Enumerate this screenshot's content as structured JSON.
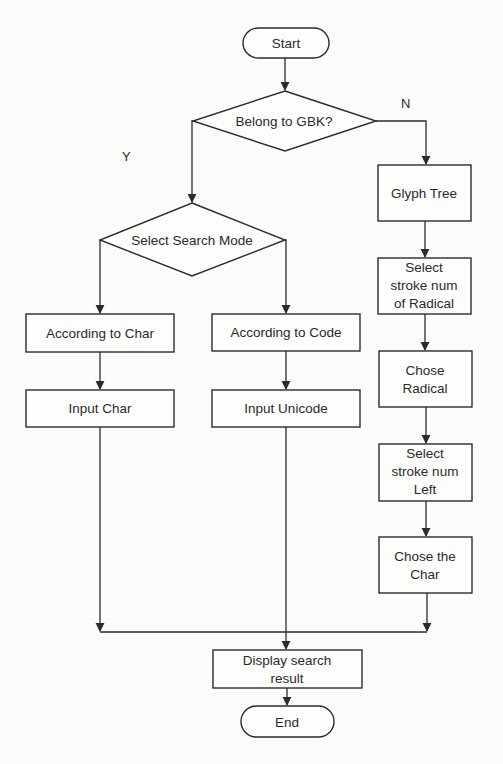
{
  "diagram": {
    "type": "flowchart",
    "colors": {
      "stroke": "#2b2b2b",
      "text": "#2a2a2a",
      "background": "#fbfbfa"
    },
    "nodes": {
      "start": {
        "label": "Start",
        "shape": "terminator"
      },
      "belong_gbk": {
        "label": "Belong to GBK?",
        "shape": "decision"
      },
      "select_search_mode": {
        "label": "Select Search Mode",
        "shape": "decision"
      },
      "according_char": {
        "label": "According to Char",
        "shape": "process"
      },
      "according_code": {
        "label": "According to Code",
        "shape": "process"
      },
      "input_char": {
        "label": "Input Char",
        "shape": "process"
      },
      "input_unicode": {
        "label": "Input Unicode",
        "shape": "process"
      },
      "glyph_tree": {
        "label": "Glyph Tree",
        "shape": "process"
      },
      "select_stroke_radical": {
        "lines": [
          "Select",
          "stroke num",
          "of Radical"
        ],
        "shape": "process"
      },
      "chose_radical": {
        "lines": [
          "Chose",
          "Radical"
        ],
        "shape": "process"
      },
      "select_stroke_left": {
        "lines": [
          "Select",
          "stroke num",
          "Left"
        ],
        "shape": "process"
      },
      "chose_char": {
        "lines": [
          "Chose the",
          "Char"
        ],
        "shape": "process"
      },
      "display_result": {
        "lines": [
          "Display search",
          "result"
        ],
        "shape": "process"
      },
      "end": {
        "label": "End",
        "shape": "terminator"
      }
    },
    "branch_labels": {
      "yes": "Y",
      "no": "N"
    },
    "edges": [
      {
        "from": "start",
        "to": "belong_gbk"
      },
      {
        "from": "belong_gbk",
        "to": "select_search_mode",
        "label": "Y"
      },
      {
        "from": "belong_gbk",
        "to": "glyph_tree",
        "label": "N"
      },
      {
        "from": "select_search_mode",
        "to": "according_char"
      },
      {
        "from": "select_search_mode",
        "to": "according_code"
      },
      {
        "from": "according_char",
        "to": "input_char"
      },
      {
        "from": "according_code",
        "to": "input_unicode"
      },
      {
        "from": "glyph_tree",
        "to": "select_stroke_radical"
      },
      {
        "from": "select_stroke_radical",
        "to": "chose_radical"
      },
      {
        "from": "chose_radical",
        "to": "select_stroke_left"
      },
      {
        "from": "select_stroke_left",
        "to": "chose_char"
      },
      {
        "from": "input_char",
        "to": "display_result"
      },
      {
        "from": "input_unicode",
        "to": "display_result"
      },
      {
        "from": "chose_char",
        "to": "display_result"
      },
      {
        "from": "display_result",
        "to": "end"
      }
    ]
  }
}
